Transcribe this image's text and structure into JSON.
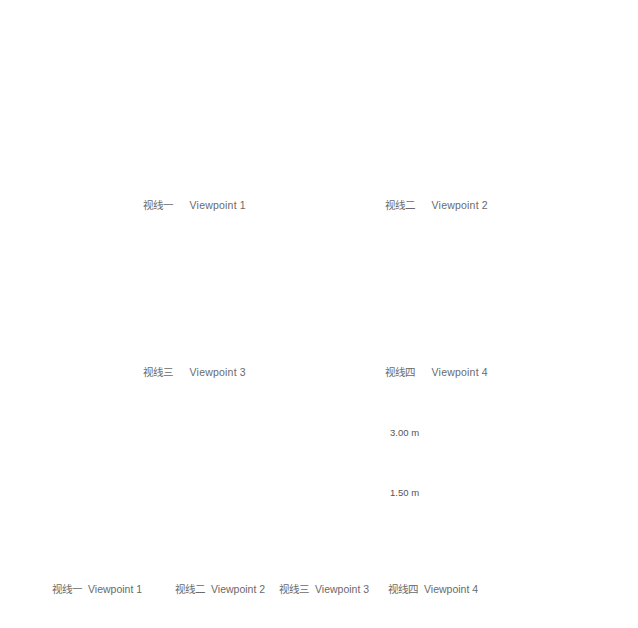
{
  "figure": {
    "viewpoints": [
      {
        "id": 1,
        "label_zh": "视线一",
        "label_en": "Viewpoint 1",
        "description": "exterior view of woven pavilion in front of trees"
      },
      {
        "id": 2,
        "label_zh": "视线二",
        "label_en": "Viewpoint 2",
        "description": "interior view looking up at radial woven structure"
      },
      {
        "id": 3,
        "label_zh": "视线三",
        "label_en": "Viewpoint 3",
        "description": "circular oculus view of sky with airplane"
      },
      {
        "id": 4,
        "label_zh": "视线四",
        "label_en": "Viewpoint 4",
        "description": "view through arched opening"
      }
    ],
    "section": {
      "levels": [
        {
          "label": "3.00 m"
        },
        {
          "label": "1.50 m"
        }
      ],
      "labels": [
        {
          "zh": "视线一",
          "en": "Viewpoint 1"
        },
        {
          "zh": "视线二",
          "en": "Viewpoint 2"
        },
        {
          "zh": "视线三",
          "en": "Viewpoint 3"
        },
        {
          "zh": "视线四",
          "en": "Viewpoint 4"
        }
      ]
    },
    "colors": {
      "tree": "#d9d9d9",
      "pavilion_stroke": "#555555",
      "figure": "#2e2e2e",
      "ground": "#111111",
      "text": "#6a6a6a"
    }
  }
}
